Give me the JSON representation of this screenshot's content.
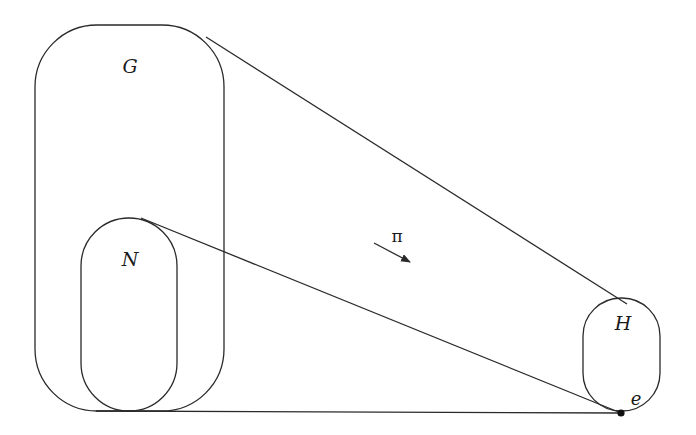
{
  "diagram": {
    "type": "quotient-map",
    "sets": [
      {
        "id": "G",
        "label": "G"
      },
      {
        "id": "N",
        "label": "N"
      },
      {
        "id": "H",
        "label": "H"
      }
    ],
    "map": {
      "label": "π",
      "from": "G",
      "to": "H"
    },
    "point": {
      "label": "e",
      "in": "H"
    },
    "colors": {
      "stroke": "#2a2a2a",
      "text": "#1a1a1a",
      "background": "#ffffff"
    }
  }
}
